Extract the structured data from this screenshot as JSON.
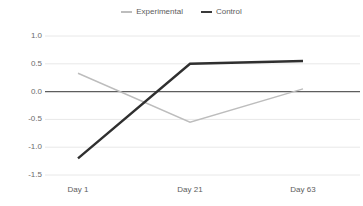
{
  "legend": {
    "position": "top-center",
    "entries": [
      {
        "name": "experimental",
        "label": "Experimental",
        "color": "#bdbdbd",
        "swatch": "line-swatch-icon"
      },
      {
        "name": "control",
        "label": "Control",
        "color": "#3a3a3a",
        "swatch": "line-swatch-icon"
      }
    ]
  },
  "axes": {
    "y_ticks": [
      "1.0",
      "0.5",
      "0.0",
      "-0.5",
      "-1.0",
      "-1.5"
    ],
    "x_ticks": [
      "Day 1",
      "Day 21",
      "Day 63"
    ]
  },
  "chart_data": {
    "type": "line",
    "title": "",
    "subtitle": "",
    "xlabel": "",
    "ylabel": "",
    "categories": [
      "Day 1",
      "Day 21",
      "Day 63"
    ],
    "x": [
      1,
      21,
      63
    ],
    "ylim": [
      -1.5,
      1.0
    ],
    "yticks": [
      1.0,
      0.5,
      0.0,
      -0.5,
      -1.0,
      -1.5
    ],
    "grid": true,
    "grid_color": "#e8e8e8",
    "zero_line": true,
    "zero_line_color": "#5e5e5e",
    "legend_position": "top-center",
    "series": [
      {
        "name": "Experimental",
        "color": "#bdbdbd",
        "width": 1.4,
        "values": [
          0.33,
          -0.55,
          0.05
        ]
      },
      {
        "name": "Control",
        "color": "#2f2f2f",
        "width": 2.4,
        "values": [
          -1.2,
          0.5,
          0.55
        ]
      }
    ]
  }
}
